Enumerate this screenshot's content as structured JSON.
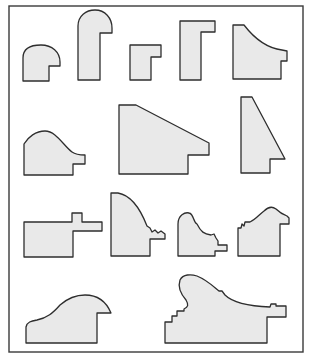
{
  "diagram": {
    "colors": {
      "background": "#ffffff",
      "frame_stroke": "#3a3a3a",
      "profile_fill": "#e9e9e9",
      "profile_stroke": "#2e2e2e"
    },
    "frame": {
      "x": 9,
      "y": 6,
      "width": 294,
      "height": 346
    },
    "profiles": [
      {
        "id": "profile-1",
        "d": "M23,81 L23,58 C23,48 32,45 41,45 C52,45 60,52 60,62 L60,66 L49,66 L49,81 Z"
      },
      {
        "id": "profile-2",
        "d": "M78,80 L78,26 C78,16 86,10 95,10 C105,10 112,18 112,28 L112,33 L100,33 L100,80 Z"
      },
      {
        "id": "profile-3",
        "d": "M130,80 L130,45 L161,45 L161,57 L151,57 L151,80 Z"
      },
      {
        "id": "profile-4",
        "d": "M180,80 L180,21 L215,21 L215,32 L201,32 L201,80 Z"
      },
      {
        "id": "profile-5",
        "d": "M233,79 L233,25 L244,25 C254,38 266,48 282,50 L287,51 L287,61 L281,61 L281,79 Z"
      },
      {
        "id": "profile-6",
        "d": "M24,175 L24,144 C28,137 36,131 45,131 C56,131 63,145 72,152 C76,155 80,155 85,155 L85,164 L73,164 L73,175 Z"
      },
      {
        "id": "profile-7",
        "d": "M119,174 L119,105 L136,105 L209,143 L209,155 L188,155 L188,174 Z"
      },
      {
        "id": "profile-8",
        "d": "M241,173 L241,97 L252,97 L285,159 L270,159 L270,173 Z"
      },
      {
        "id": "profile-9",
        "d": "M24,257 L24,222 L72,222 L72,213 L82,213 L82,222 L102,222 L102,231 L73,231 L73,257 Z"
      },
      {
        "id": "profile-10",
        "d": "M111,256 L111,193 L118,193 C130,195 140,208 147,226 L150,228 L152,232 L155,230 L158,233 L161,231 L165,234 L165,239 L150,239 L150,256 Z"
      },
      {
        "id": "profile-11",
        "d": "M178,256 L178,224 C178,215 185,212 189,213 C194,214 193,222 197,224 C201,232 204,234 211,235 L214,234 L216,238 L218,241 L218,245 L227,245 L227,251 L215,251 L215,256 Z"
      },
      {
        "id": "profile-12",
        "d": "M238,256 L238,228 L241,228 L242,224 L244,226 L245,222 L250,222 C255,220 260,214 264,211 C268,207 272,206 276,209 C279,212 282,214 287,216 L289,218 L289,224 L280,224 L280,256 Z"
      },
      {
        "id": "profile-13",
        "d": "M26,343 L26,327 C27,322 31,321 37,320 C47,318 53,313 60,305 C68,298 76,295 85,295 C97,295 106,301 111,313 L97,313 L97,343 Z"
      },
      {
        "id": "profile-14",
        "d": "M165,343 L165,322 L172,322 L172,316 L177,316 L177,311 L184,311 L184,309 C188,307 189,305 186,300 C180,293 178,286 180,280 C183,274 191,274 197,276 C207,280 214,287 219,291 L222,291 L225,295 C232,302 246,306 270,307 L271,304 L276,304 L276,306 L286,306 L286,317 L267,317 L267,343 Z"
      }
    ]
  }
}
